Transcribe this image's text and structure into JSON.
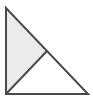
{
  "figure": {
    "name": "right-triangle-with-median",
    "canvas": {
      "width": 93,
      "height": 101,
      "background_color": "#ffffff"
    },
    "style": {
      "stroke_color": "#4a4a4a",
      "stroke_width": 2,
      "shaded_fill_color": "#ebebeb",
      "unshaded_fill_color": "#ffffff",
      "interior_line_color": "#4a4a4a",
      "interior_line_width": 2
    },
    "vertices": {
      "top_left": {
        "label": "",
        "x": 6,
        "y": 8
      },
      "bottom_left": {
        "label": "",
        "x": 6,
        "y": 94
      },
      "bottom_right": {
        "label": "",
        "x": 88,
        "y": 94
      },
      "hypotenuse_midpoint": {
        "label": "",
        "x": 47,
        "y": 51
      }
    },
    "outer_triangle": {
      "name": "right-triangle-outline",
      "points": "6,8 6,94 88,94",
      "right_angle_at": "bottom_left"
    },
    "regions": [
      {
        "name": "shaded-half-triangle",
        "points": "6,8 6,94 47,51",
        "fill": "#ebebeb",
        "shaded": true
      },
      {
        "name": "unshaded-half-triangle",
        "points": "6,94 47,51 88,94",
        "fill": "#ffffff",
        "shaded": false
      }
    ],
    "interior_line": {
      "name": "median-to-hypotenuse",
      "x1": 6,
      "y1": 94,
      "x2": 47,
      "y2": 51
    },
    "labels": []
  }
}
